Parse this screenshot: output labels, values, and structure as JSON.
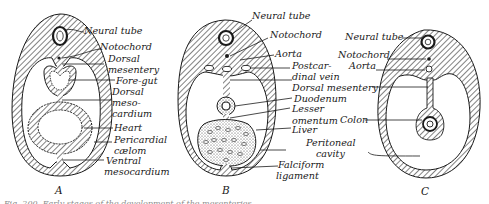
{
  "figure": {
    "panels": [
      {
        "id": "A",
        "label": "A",
        "labels": [
          "Neural tube",
          "Notochord",
          "Dorsal",
          "mesentery",
          "Fore-gut",
          "Dorsal",
          "meso-",
          "cardium",
          "Heart",
          "Pericardial",
          "cælom",
          "Ventral",
          "mesocardium"
        ]
      },
      {
        "id": "B",
        "label": "B",
        "labels": [
          "Neural tube",
          "Notochord",
          "Aorta",
          "Postcar-",
          "dinal vein",
          "Dorsal mesentery",
          "Duodenum",
          "Lesser",
          "omentum",
          "Liver",
          "Peritoneal",
          "cavity",
          "Falciform",
          "ligament"
        ]
      },
      {
        "id": "C",
        "label": "C",
        "labels": [
          "Neural tube",
          "Notochord",
          "Aorta",
          "Colon"
        ]
      }
    ],
    "caption_partial": "Fig. 200. Early stages of the development of the mesenteries..."
  },
  "colors": {
    "ink": "#1a1a1a",
    "paper": "#ffffff",
    "stipple": "#555555"
  }
}
